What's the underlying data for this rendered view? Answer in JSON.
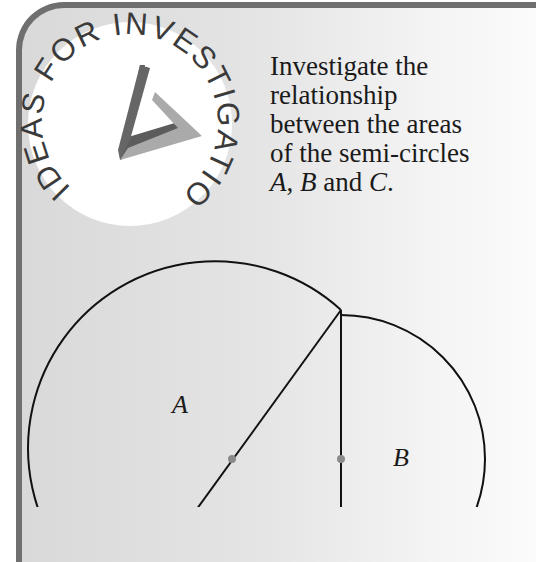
{
  "badge": {
    "text": "IDEAS FOR INVESTIGATION"
  },
  "prompt": {
    "line1": "Investigate the",
    "line2": "relationship",
    "line3": "between the areas",
    "line4": "of the semi-circles",
    "label_a": "A",
    "sep1": ", ",
    "label_b": "B",
    "and": " and ",
    "label_c": "C",
    "period": "."
  },
  "diagram": {
    "labels": {
      "a": "A",
      "b": "B"
    }
  },
  "colors": {
    "border": "#6f6f6f",
    "panel_bg": "#e2e2e2",
    "line": "#111111",
    "dot": "#8a8a8a",
    "logo_dark": "#5a5a5a",
    "logo_light": "#a9a9a9"
  }
}
